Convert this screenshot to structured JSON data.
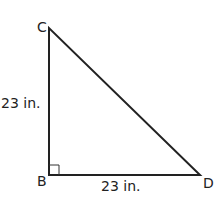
{
  "diagram": {
    "type": "right-triangle",
    "vertices": {
      "C": {
        "label": "C",
        "x": 49,
        "y": 28
      },
      "B": {
        "label": "B",
        "x": 49,
        "y": 175
      },
      "D": {
        "label": "D",
        "x": 200,
        "y": 175
      }
    },
    "right_angle_at": "B",
    "sides": {
      "CB": {
        "label": "23 in."
      },
      "BD": {
        "label": "23 in."
      }
    },
    "stroke_color": "#222222"
  }
}
